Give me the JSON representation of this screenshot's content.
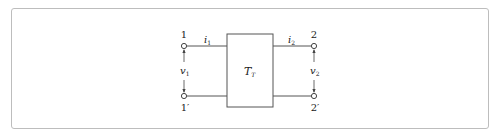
{
  "diagram": {
    "type": "two-port network",
    "block_label": "T",
    "block_label_sub": "T",
    "port1": {
      "top_terminal": "1",
      "bottom_terminal": "1′",
      "current": "i",
      "current_sub": "1",
      "voltage": "v",
      "voltage_sub": "1"
    },
    "port2": {
      "top_terminal": "2",
      "bottom_terminal": "2′",
      "current": "i",
      "current_sub": "2",
      "voltage": "v",
      "voltage_sub": "2"
    },
    "colors": {
      "line": "#555555",
      "frame": "#bdbdbd",
      "text": "#222222"
    }
  }
}
